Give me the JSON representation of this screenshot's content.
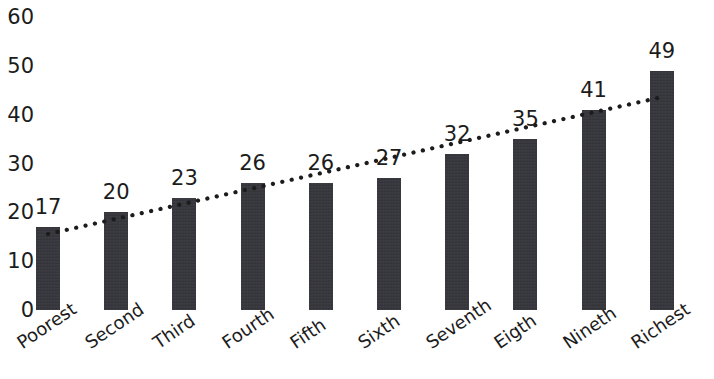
{
  "chart_data": {
    "type": "bar",
    "title": "",
    "subtitle": "",
    "xlabel": "",
    "ylabel": "",
    "categories": [
      "Poorest",
      "Second",
      "Third",
      "Fourth",
      "Fifth",
      "Sixth",
      "Seventh",
      "Eigth",
      "Nineth",
      "Richest"
    ],
    "values": [
      17,
      20,
      23,
      26,
      26,
      27,
      32,
      35,
      41,
      49
    ],
    "value_labels": [
      "17",
      "20",
      "23",
      "26",
      "26",
      "27",
      "32",
      "35",
      "41",
      "49"
    ],
    "ylim": [
      0,
      60
    ],
    "ytick_labels": [
      "0",
      "10",
      "20",
      "30",
      "40",
      "50",
      "60"
    ],
    "ytick_values": [
      0,
      10,
      20,
      30,
      40,
      50,
      60
    ],
    "grid": false,
    "legend": null,
    "series": [
      {
        "name": "bars",
        "kind": "bar",
        "values": [
          17,
          20,
          23,
          26,
          26,
          27,
          32,
          35,
          41,
          49
        ],
        "color": "#33333a"
      },
      {
        "name": "trendline",
        "kind": "line",
        "style": "dotted",
        "color": "#1c1c1c",
        "values": [
          17,
          20,
          23,
          26,
          26,
          27,
          32,
          35,
          41,
          49
        ]
      }
    ]
  },
  "colors": {
    "bar": "#33333a",
    "text": "#1c1c1c",
    "background": "#ffffff",
    "trendline": "#1c1c1c"
  }
}
